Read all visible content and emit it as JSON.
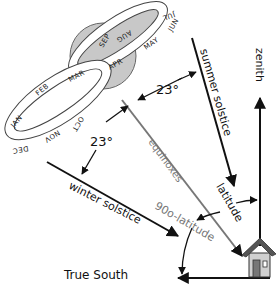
{
  "diagram": {
    "type": "sun-angle-diagram",
    "colors": {
      "sun_fill": "#c8c8c8",
      "line": "#111111",
      "gray_line": "#777777",
      "house_roof": "#555555",
      "house_wall": "#d0d0d0"
    },
    "analemma_months": [
      "JAN",
      "FEB",
      "MAR",
      "APR",
      "MAY",
      "JUN",
      "JUL",
      "AUG",
      "SEP",
      "OCT",
      "NOV",
      "DEC"
    ],
    "labels": {
      "summer_solstice": "summer solstice",
      "winter_solstice": "winter solstice",
      "equinoxes": "equinoxes",
      "zenith": "zenith",
      "true_south": "True South",
      "latitude": "latitude",
      "ninety_minus_latitude": "90o-latitude",
      "angle_top": "23°",
      "angle_bottom": "23°"
    }
  }
}
